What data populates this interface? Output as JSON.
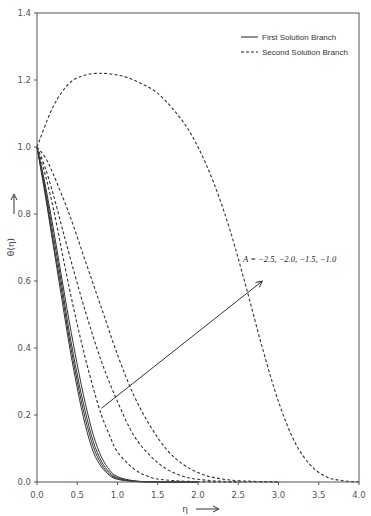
{
  "chart_data": {
    "type": "line",
    "title": "",
    "xlabel": "η",
    "ylabel": "θ(η)",
    "xlim": [
      0.0,
      4.0
    ],
    "ylim": [
      0.0,
      1.4
    ],
    "x_ticks": [
      "0.0",
      "0.5",
      "1.0",
      "1.5",
      "2.0",
      "2.5",
      "3.0",
      "3.5",
      "4.0"
    ],
    "y_ticks": [
      "0.0",
      "0.2",
      "0.4",
      "0.6",
      "0.8",
      "1.0",
      "1.2",
      "1.4"
    ],
    "grid": false,
    "legend_position": "upper right",
    "legend": [
      {
        "label": "First Solution Branch",
        "style": "solid"
      },
      {
        "label": "Second Solution Branch",
        "style": "dashed"
      }
    ],
    "annotation": {
      "text": "A = −2.5, −2.0, −1.5, −1.0",
      "arrow_from": [
        0.8,
        0.22
      ],
      "arrow_to": [
        2.8,
        0.6
      ]
    },
    "series": [
      {
        "name": "First Solution Branch, A=-2.5",
        "style": "solid",
        "x": [
          0.0,
          0.1,
          0.2,
          0.3,
          0.4,
          0.5,
          0.6,
          0.7,
          0.8,
          0.9,
          1.0,
          1.2,
          1.5,
          2.0
        ],
        "y": [
          1.0,
          0.86,
          0.71,
          0.56,
          0.41,
          0.28,
          0.17,
          0.09,
          0.045,
          0.02,
          0.008,
          0.002,
          0.0,
          0.0
        ]
      },
      {
        "name": "First Solution Branch, A=-2.0",
        "style": "solid",
        "x": [
          0.0,
          0.1,
          0.2,
          0.3,
          0.4,
          0.5,
          0.6,
          0.7,
          0.8,
          0.9,
          1.0,
          1.2,
          1.5,
          2.0
        ],
        "y": [
          1.0,
          0.87,
          0.72,
          0.58,
          0.43,
          0.3,
          0.19,
          0.105,
          0.053,
          0.024,
          0.01,
          0.002,
          0.0,
          0.0
        ]
      },
      {
        "name": "First Solution Branch, A=-1.5",
        "style": "solid",
        "x": [
          0.0,
          0.1,
          0.2,
          0.3,
          0.4,
          0.5,
          0.6,
          0.7,
          0.8,
          0.9,
          1.0,
          1.2,
          1.5,
          2.0
        ],
        "y": [
          1.0,
          0.88,
          0.74,
          0.6,
          0.45,
          0.32,
          0.21,
          0.12,
          0.062,
          0.029,
          0.013,
          0.003,
          0.0,
          0.0
        ]
      },
      {
        "name": "First Solution Branch, A=-1.0",
        "style": "solid",
        "x": [
          0.0,
          0.1,
          0.2,
          0.3,
          0.4,
          0.5,
          0.6,
          0.7,
          0.8,
          0.9,
          1.0,
          1.2,
          1.5,
          2.0
        ],
        "y": [
          1.0,
          0.89,
          0.76,
          0.62,
          0.48,
          0.35,
          0.235,
          0.14,
          0.075,
          0.036,
          0.016,
          0.004,
          0.0,
          0.0
        ]
      },
      {
        "name": "Second Solution Branch, A=-2.5",
        "style": "dashed",
        "x": [
          0.0,
          0.1,
          0.2,
          0.3,
          0.4,
          0.5,
          0.6,
          0.7,
          0.8,
          0.9,
          1.0,
          1.2,
          1.4,
          1.6,
          2.0,
          2.5
        ],
        "y": [
          1.0,
          0.92,
          0.82,
          0.7,
          0.58,
          0.47,
          0.37,
          0.28,
          0.2,
          0.14,
          0.09,
          0.04,
          0.015,
          0.006,
          0.001,
          0.0
        ]
      },
      {
        "name": "Second Solution Branch, A=-2.0",
        "style": "dashed",
        "x": [
          0.0,
          0.1,
          0.2,
          0.3,
          0.4,
          0.6,
          0.8,
          1.0,
          1.2,
          1.4,
          1.6,
          1.8,
          2.0,
          2.4,
          3.0
        ],
        "y": [
          1.0,
          0.94,
          0.86,
          0.77,
          0.68,
          0.51,
          0.36,
          0.24,
          0.14,
          0.08,
          0.04,
          0.018,
          0.008,
          0.001,
          0.0
        ]
      },
      {
        "name": "Second Solution Branch, A=-1.5",
        "style": "dashed",
        "x": [
          0.0,
          0.1,
          0.2,
          0.4,
          0.6,
          0.8,
          1.0,
          1.2,
          1.4,
          1.6,
          1.8,
          2.0,
          2.2,
          2.5,
          3.0
        ],
        "y": [
          1.0,
          0.97,
          0.92,
          0.8,
          0.66,
          0.52,
          0.38,
          0.26,
          0.17,
          0.1,
          0.055,
          0.028,
          0.013,
          0.004,
          0.0
        ]
      },
      {
        "name": "Second Solution Branch, A=-1.0",
        "style": "dashed",
        "x": [
          0.0,
          0.2,
          0.4,
          0.6,
          0.8,
          1.0,
          1.2,
          1.5,
          1.8,
          2.0,
          2.2,
          2.4,
          2.6,
          2.8,
          3.0,
          3.2,
          3.4,
          3.6,
          3.8,
          4.0
        ],
        "y": [
          1.0,
          1.12,
          1.19,
          1.215,
          1.22,
          1.215,
          1.2,
          1.16,
          1.08,
          1.0,
          0.89,
          0.75,
          0.58,
          0.4,
          0.24,
          0.12,
          0.05,
          0.015,
          0.004,
          0.0
        ]
      }
    ]
  }
}
